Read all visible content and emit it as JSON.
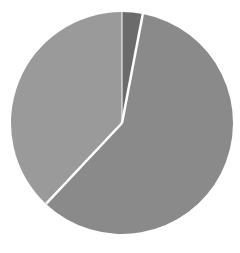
{
  "chart_data": {
    "type": "pie",
    "title": "",
    "legend": [],
    "start_angle_deg": 0,
    "direction": "clockwise",
    "slices": [
      {
        "label": "",
        "value": 3,
        "color": "#6b6b6b"
      },
      {
        "label": "",
        "value": 59,
        "color": "#8a8a8a"
      },
      {
        "label": "",
        "value": 38,
        "color": "#9a9a9a"
      }
    ],
    "separator_color": "#ffffff",
    "center": [
      122,
      123
    ],
    "radius": 111
  }
}
